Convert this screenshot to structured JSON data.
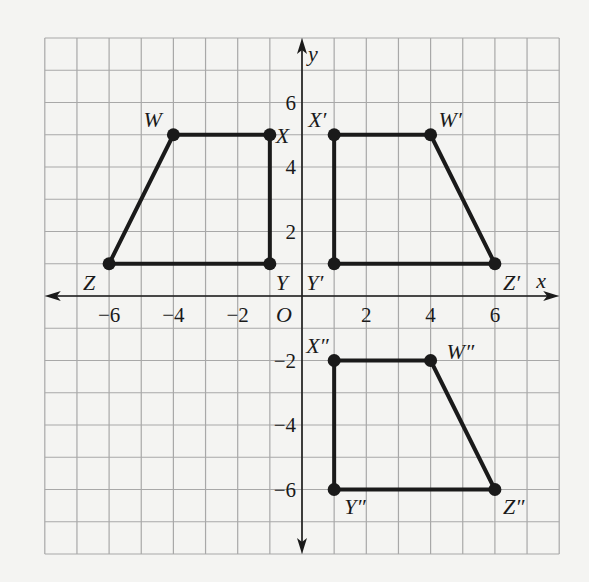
{
  "diagram": {
    "type": "coordinate-plane-transformations",
    "grid": {
      "x_min": -8,
      "x_max": 8,
      "y_min": -8,
      "y_max": 8,
      "step": 1,
      "grid_color": "#a8a8a8",
      "ink_color": "#1a1a1a"
    },
    "axes": {
      "x_label": "x",
      "y_label": "y",
      "origin_label": "O",
      "x_ticks": [
        {
          "value": -6,
          "label": "−6"
        },
        {
          "value": -4,
          "label": "−4"
        },
        {
          "value": -2,
          "label": "−2"
        },
        {
          "value": 2,
          "label": "2"
        },
        {
          "value": 4,
          "label": "4"
        },
        {
          "value": 6,
          "label": "6"
        }
      ],
      "y_ticks": [
        {
          "value": 6,
          "label": "6"
        },
        {
          "value": 4,
          "label": "4"
        },
        {
          "value": 2,
          "label": "2"
        },
        {
          "value": -2,
          "label": "−2"
        },
        {
          "value": -4,
          "label": "−4"
        },
        {
          "value": -6,
          "label": "−6"
        }
      ]
    },
    "figures": [
      {
        "name": "WXYZ",
        "vertices": [
          {
            "label": "W",
            "x": -4,
            "y": 5,
            "dx": -30,
            "dy": -8
          },
          {
            "label": "X",
            "x": -1,
            "y": 5,
            "dx": 6,
            "dy": 8
          },
          {
            "label": "Y",
            "x": -1,
            "y": 1,
            "dx": 6,
            "dy": 26
          },
          {
            "label": "Z",
            "x": -6,
            "y": 1,
            "dx": -26,
            "dy": 26
          }
        ]
      },
      {
        "name": "W'X'Y'Z'",
        "vertices": [
          {
            "label": "W′",
            "x": 4,
            "y": 5,
            "dx": 8,
            "dy": -8
          },
          {
            "label": "X′",
            "x": 1,
            "y": 5,
            "dx": -26,
            "dy": -8
          },
          {
            "label": "Y′",
            "x": 1,
            "y": 1,
            "dx": -28,
            "dy": 26
          },
          {
            "label": "Z′",
            "x": 6,
            "y": 1,
            "dx": 8,
            "dy": 26
          }
        ]
      },
      {
        "name": "W''X''Y''Z''",
        "vertices": [
          {
            "label": "W″",
            "x": 4,
            "y": -2,
            "dx": 16,
            "dy": -2
          },
          {
            "label": "X″",
            "x": 1,
            "y": -2,
            "dx": -28,
            "dy": -8
          },
          {
            "label": "Y″",
            "x": 1,
            "y": -6,
            "dx": 10,
            "dy": 24
          },
          {
            "label": "Z″",
            "x": 6,
            "y": -6,
            "dx": 8,
            "dy": 24
          }
        ]
      }
    ]
  }
}
